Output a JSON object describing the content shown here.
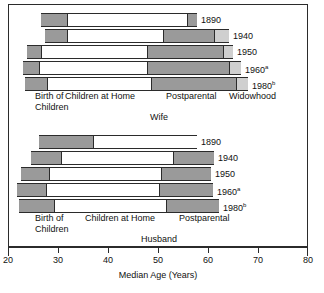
{
  "chart_data": {
    "type": "bar",
    "orientation": "horizontal",
    "title": "",
    "xlabel": "Median Age (Years)",
    "ylabel": "",
    "xlim": [
      20,
      80
    ],
    "xticks": [
      20,
      30,
      40,
      50,
      60,
      70,
      80
    ],
    "grid": false,
    "legend": "none",
    "stage_names": [
      "Birth of Children",
      "Children at Home",
      "Postparental",
      "Widowhood"
    ],
    "stage_colors": {
      "birth_of_children": "#9a9a9a",
      "children_at_home": "#ffffff",
      "postparental": "#9a9a9a",
      "widowhood": "#cfcfcf",
      "outline": "#2b2b2b"
    },
    "panels": [
      {
        "name": "Wife",
        "label": "Wife",
        "categories": [
          "1890",
          "1940",
          "1950",
          "1960",
          "1980"
        ],
        "category_superscripts": [
          "",
          "",
          "",
          "a",
          "b"
        ],
        "rows": [
          {
            "year": "1890",
            "sup": "",
            "start": 26.4,
            "birth_end": 31.6,
            "children_end": 55.6,
            "postparental_end": 57.6,
            "widowhood_end": 57.6
          },
          {
            "year": "1940",
            "sup": "",
            "start": 27.2,
            "birth_end": 31.6,
            "children_end": 50.8,
            "postparental_end": 61.0,
            "widowhood_end": 64.0
          },
          {
            "year": "1950",
            "sup": "",
            "start": 23.6,
            "birth_end": 26.4,
            "children_end": 47.6,
            "postparental_end": 62.8,
            "widowhood_end": 64.8
          },
          {
            "year": "1960",
            "sup": "a",
            "start": 22.8,
            "birth_end": 26.0,
            "children_end": 47.6,
            "postparental_end": 64.0,
            "widowhood_end": 66.4
          },
          {
            "year": "1980",
            "sup": "b",
            "start": 23.2,
            "birth_end": 27.6,
            "children_end": 48.4,
            "postparental_end": 65.4,
            "widowhood_end": 67.8
          }
        ],
        "stage_labels": [
          {
            "text": "Birth of\nChildren",
            "stage": "birth_of_children"
          },
          {
            "text": "Children at Home",
            "stage": "children_at_home"
          },
          {
            "text": "Postparental",
            "stage": "postparental"
          },
          {
            "text": "Widowhood",
            "stage": "widowhood"
          }
        ]
      },
      {
        "name": "Husband",
        "label": "Husband",
        "categories": [
          "1890",
          "1940",
          "1950",
          "1960",
          "1980"
        ],
        "category_superscripts": [
          "",
          "",
          "",
          "a",
          "b"
        ],
        "rows": [
          {
            "year": "1890",
            "sup": "",
            "start": 26.0,
            "birth_end": 36.8,
            "children_end": 57.6,
            "postparental_end": 57.6,
            "widowhood_end": 57.6
          },
          {
            "year": "1940",
            "sup": "",
            "start": 24.4,
            "birth_end": 30.4,
            "children_end": 52.8,
            "postparental_end": 61.0,
            "widowhood_end": 61.0
          },
          {
            "year": "1950",
            "sup": "",
            "start": 22.4,
            "birth_end": 28.0,
            "children_end": 50.4,
            "postparental_end": 60.4,
            "widowhood_end": 60.4
          },
          {
            "year": "1960",
            "sup": "a",
            "start": 21.6,
            "birth_end": 27.4,
            "children_end": 50.0,
            "postparental_end": 60.8,
            "widowhood_end": 60.8
          },
          {
            "year": "1980",
            "sup": "b",
            "start": 22.0,
            "birth_end": 29.0,
            "children_end": 51.4,
            "postparental_end": 62.0,
            "widowhood_end": 62.0
          }
        ],
        "stage_labels": [
          {
            "text": "Birth of\nChildren",
            "stage": "birth_of_children"
          },
          {
            "text": "Children at Home",
            "stage": "children_at_home"
          },
          {
            "text": "Postparental",
            "stage": "postparental"
          }
        ]
      }
    ]
  },
  "axis": {
    "title": "Median Age (Years)",
    "ticks": [
      {
        "value": "20"
      },
      {
        "value": "30"
      },
      {
        "value": "40"
      },
      {
        "value": "50"
      },
      {
        "value": "60"
      },
      {
        "value": "70"
      },
      {
        "value": "80"
      }
    ]
  },
  "wife": {
    "panel_title": "Wife",
    "years": [
      {
        "label": "1890",
        "sup": ""
      },
      {
        "label": "1940",
        "sup": ""
      },
      {
        "label": "1950",
        "sup": ""
      },
      {
        "label": "1960",
        "sup": "a"
      },
      {
        "label": "1980",
        "sup": "b"
      }
    ],
    "stage_label_birth": "Birth of\nChildren",
    "stage_label_children": "Children at Home",
    "stage_label_postparental": "Postparental",
    "stage_label_widowhood": "Widowhood"
  },
  "husband": {
    "panel_title": "Husband",
    "years": [
      {
        "label": "1890",
        "sup": ""
      },
      {
        "label": "1940",
        "sup": ""
      },
      {
        "label": "1950",
        "sup": ""
      },
      {
        "label": "1960",
        "sup": "a"
      },
      {
        "label": "1980",
        "sup": "b"
      }
    ],
    "stage_label_birth": "Birth of\nChildren",
    "stage_label_children": "Children at Home",
    "stage_label_postparental": "Postparental"
  }
}
